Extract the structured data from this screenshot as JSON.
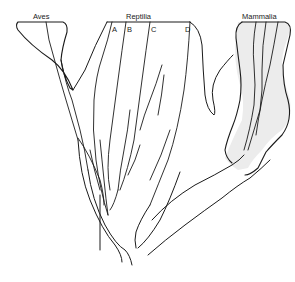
{
  "diagram": {
    "type": "phylogenetic-tree",
    "groups": {
      "aves": "Aves",
      "reptilia": "Reptilia",
      "mammalia": "Mammalia"
    },
    "reptile_lineages": [
      "A",
      "B",
      "C",
      "D"
    ],
    "colors": {
      "line": "#1a1a1a",
      "shading": "#e6e6e6",
      "background": "#ffffff"
    }
  }
}
